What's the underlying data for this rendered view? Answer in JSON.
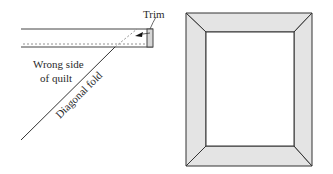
{
  "left_diagram": {
    "labels": {
      "trim": "Trim",
      "wrong_side_line1": "Wrong side",
      "wrong_side_line2": "of quilt",
      "diagonal_fold": "Diagonal fold"
    }
  },
  "right_diagram": {
    "description": "Mitered border frame",
    "border_fill": "#e4e4e4",
    "line_color": "#333333"
  }
}
